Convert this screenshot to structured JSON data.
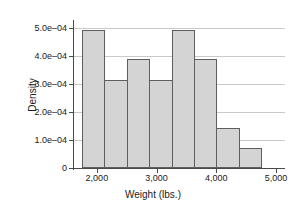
{
  "chart_data": {
    "type": "bar",
    "title": "",
    "xlabel": "Weight (lbs.)",
    "ylabel": "Density",
    "xlim": [
      1600,
      5150
    ],
    "ylim": [
      0,
      0.00052
    ],
    "grid": true,
    "legend": null,
    "bin_width": 375,
    "x_tick_values": [
      2000,
      3000,
      4000,
      5000
    ],
    "x_tick_labels": [
      "2,000",
      "3,000",
      "4,000",
      "5,000"
    ],
    "y_tick_values": [
      0,
      0.0001,
      0.0002,
      0.0003,
      0.0004,
      0.0005
    ],
    "y_tick_labels": [
      "0",
      "1.0e–04",
      "2.0e–04",
      "3.0e–04",
      "4.0e–04",
      "5.0e–04"
    ],
    "bin_edges": [
      1750,
      2125,
      2500,
      2875,
      3250,
      3625,
      4000,
      4375,
      4750
    ],
    "categories": [
      "1750-2125",
      "2125-2500",
      "2500-2875",
      "2875-3250",
      "3250-3625",
      "3625-4000",
      "4000-4375",
      "4375-4750"
    ],
    "values": [
      0.00049,
      0.000315,
      0.000387,
      0.000315,
      0.00049,
      0.000387,
      0.000143,
      7e-05
    ],
    "bar_fill_color": "#d4d4d4",
    "bar_edge_color": "#5e5e5e",
    "grid_color": "#c9c9c9",
    "axis_color": "#4a4a4a"
  }
}
